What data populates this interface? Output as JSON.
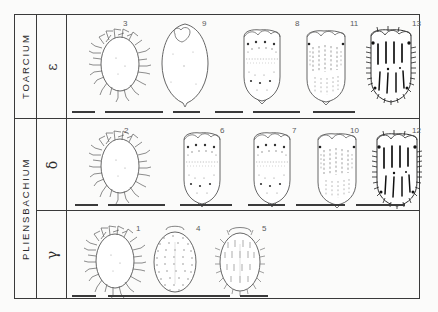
{
  "plate": {
    "title": "Ostracod valve morphology plate",
    "background_color": "#fbfbfa",
    "ink_color": "#2b2b2b",
    "rule_color": "#3a3a3a"
  },
  "stages": [
    {
      "name": "TOARCIUM",
      "row_index": 0,
      "subzones": [
        {
          "symbol": "ε",
          "label": "epsilon"
        }
      ]
    },
    {
      "name": "PLIENSBACHIUM",
      "row_index": 1,
      "subzones": [
        {
          "symbol": "δ",
          "label": "delta"
        },
        {
          "symbol": "γ",
          "label": "gamma"
        }
      ]
    }
  ],
  "rows": [
    {
      "stage": "TOARCIUM",
      "subzone": "ε",
      "figures": [
        {
          "number": "3",
          "style": "spiny-oval",
          "scale_bar": true
        },
        {
          "number": "9",
          "style": "smooth-lemon",
          "scale_bar": true
        },
        {
          "number": "8",
          "style": "punctate-ovate",
          "scale_bar": true
        },
        {
          "number": "11",
          "style": "ribbed-rect",
          "scale_bar": true
        },
        {
          "number": "13",
          "style": "dark-ribbed",
          "scale_bar": true
        }
      ]
    },
    {
      "stage": "PLIENSBACHIUM",
      "subzone": "δ",
      "figures": [
        {
          "number": "2",
          "style": "spiny-oval",
          "scale_bar": true
        },
        {
          "number": "6",
          "style": "punctate-ovate",
          "scale_bar": true
        },
        {
          "number": "7",
          "style": "punctate-ovate",
          "scale_bar": true
        },
        {
          "number": "10",
          "style": "ribbed-rect",
          "scale_bar": true
        },
        {
          "number": "12",
          "style": "dark-ribbed",
          "scale_bar": true
        }
      ]
    },
    {
      "stage": "PLIENSBACHIUM",
      "subzone": "γ",
      "figures": [
        {
          "number": "1",
          "style": "spiny-oval",
          "scale_bar": true
        },
        {
          "number": "4",
          "style": "dotted-oval",
          "scale_bar": true
        },
        {
          "number": "5",
          "style": "bristly-oval",
          "scale_bar": true
        }
      ]
    }
  ],
  "figure_numbers": [
    "1",
    "2",
    "3",
    "4",
    "5",
    "6",
    "7",
    "8",
    "9",
    "10",
    "11",
    "12",
    "13"
  ],
  "table": {
    "outer_border": true,
    "column_dividers_x": [
      36,
      66
    ],
    "row_dividers_y": [
      118,
      210
    ],
    "top_y": 14,
    "bottom_y": 298,
    "left_x": 14,
    "right_x": 420
  }
}
